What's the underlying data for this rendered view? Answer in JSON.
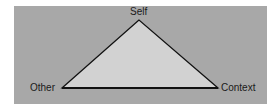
{
  "diagram": {
    "type": "triangle",
    "colors": {
      "background": "#a8a8a8",
      "fill": "#d2d2d2",
      "stroke": "#111111"
    },
    "vertices": {
      "top": {
        "label": "Self"
      },
      "left": {
        "label": "Other"
      },
      "right": {
        "label": "Context"
      }
    }
  }
}
